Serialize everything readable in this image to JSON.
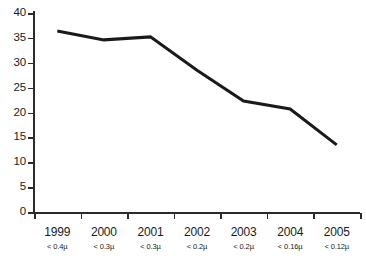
{
  "chart_data": {
    "type": "line",
    "title": "",
    "subtitle": "",
    "xlabel": "",
    "ylabel": "",
    "categories": [
      "1999",
      "2000",
      "2001",
      "2002",
      "2003",
      "2004",
      "2005"
    ],
    "category_sublabels": [
      "< 0.4µ",
      "< 0.3µ",
      "< 0.3µ",
      "< 0.2µ",
      "< 0.2µ",
      "< 0.16µ",
      "< 0.12µ"
    ],
    "series": [
      {
        "name": "",
        "values": [
          36.4,
          34.6,
          35.2,
          28.5,
          22.3,
          20.7,
          13.5
        ]
      }
    ],
    "ylim": [
      0,
      40
    ],
    "y_ticks": [
      0,
      5,
      10,
      15,
      20,
      25,
      30,
      35,
      40
    ],
    "y_tick_labels": [
      "0",
      "5",
      "10",
      "15",
      "20",
      "25",
      "30",
      "35",
      "40"
    ],
    "grid": false,
    "legend": false,
    "legend_position": "none",
    "markers": false,
    "line_color": "#1a1a1a",
    "line_width": 3,
    "axis_color": "#2b2b2b",
    "background_color": "#ffffff"
  }
}
